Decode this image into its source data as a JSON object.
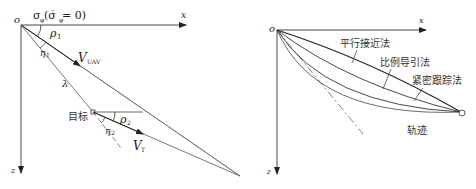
{
  "left_diagram": {
    "origin_label": "o",
    "x_axis_label": "x",
    "z_axis_label": "z",
    "sigma_label": "σ",
    "sigma_sub": "φ",
    "sigma_cond": "(σ̇",
    "sigma_cond_sub": "φ",
    "sigma_cond_end": "= 0)",
    "rho1_label": "ρ",
    "rho1_sub": "1",
    "eta1_label": "η",
    "eta1_sub": "1",
    "vuav_label": "V",
    "vuav_sub": "UAV",
    "lambda_label": "λ",
    "target_label": "目标",
    "rho2_label": "ρ",
    "rho2_sub": "2",
    "eta2_label": "η",
    "eta2_sub": "2",
    "vt_label": "V",
    "vt_sub": "T"
  },
  "right_diagram": {
    "origin_label": "o",
    "x_axis_label": "x",
    "z_axis_label": "z",
    "curves": [
      {
        "name": "parallel-approach",
        "label": "平行接近法"
      },
      {
        "name": "proportional-navigation",
        "label": "比例导引法"
      },
      {
        "name": "pure-pursuit",
        "label": "紧密跟踪法"
      }
    ],
    "trajectory_label": "轨迹"
  },
  "colors": {
    "line": "#333333",
    "light_line": "#777777"
  }
}
